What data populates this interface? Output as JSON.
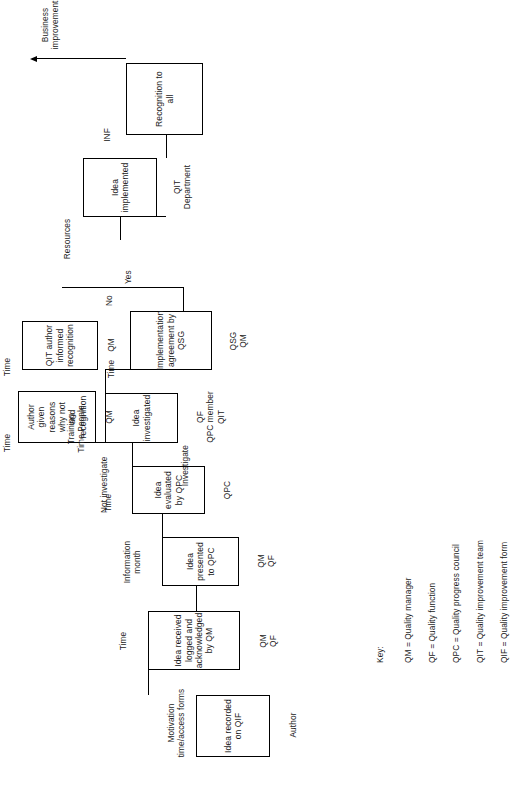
{
  "diagram": {
    "orientation": "rotated-90-ccw",
    "nodes": [
      {
        "id": "n1",
        "label": "Idea\nrecorded\non QIF"
      },
      {
        "id": "n2",
        "label": "Idea received logged\nand acknowledged\nby QM"
      },
      {
        "id": "n3",
        "label": "Idea\npresented\nto QPC"
      },
      {
        "id": "n4",
        "label": "Idea\nevaluated\nby QPC"
      },
      {
        "id": "n5",
        "label": "Idea\ninvestigated"
      },
      {
        "id": "n6",
        "label": "Author given\nreasons why not\nand recognition"
      },
      {
        "id": "n7",
        "label": "Implementation\nagreement\nby QSG"
      },
      {
        "id": "n8",
        "label": "QIT author\ninformed\nrecognition"
      },
      {
        "id": "n9",
        "label": "Idea\nimplemented"
      },
      {
        "id": "n10",
        "label": "Recognition\nto all"
      }
    ],
    "input_labels": [
      {
        "id": "i1",
        "text": "Motivation\ntime/access forms"
      },
      {
        "id": "i2",
        "text": "Time"
      },
      {
        "id": "i3",
        "text": "Information\nmonth"
      },
      {
        "id": "i4",
        "text": "Time"
      },
      {
        "id": "i5",
        "text": "Training\nTime People"
      },
      {
        "id": "i6",
        "text": "Time"
      },
      {
        "id": "i7",
        "text": "Time"
      },
      {
        "id": "i8",
        "text": "Time"
      },
      {
        "id": "i9",
        "text": "Resources"
      },
      {
        "id": "i10",
        "text": "INF"
      }
    ],
    "resource_labels": [
      {
        "id": "r1",
        "text": "Author"
      },
      {
        "id": "r2",
        "text": "QM\nQF"
      },
      {
        "id": "r3",
        "text": "QM\nQF"
      },
      {
        "id": "r4",
        "text": "QPC"
      },
      {
        "id": "r5",
        "text": "QF\nQPC member\nQIT"
      },
      {
        "id": "r6",
        "text": "QM"
      },
      {
        "id": "r7",
        "text": "QSG\nQM"
      },
      {
        "id": "r8",
        "text": "QM"
      },
      {
        "id": "r9",
        "text": "QIT\nDepartment"
      }
    ],
    "branch_labels": [
      {
        "id": "b1",
        "text": "Not investigate"
      },
      {
        "id": "b2",
        "text": "Investigate"
      },
      {
        "id": "b3",
        "text": "No"
      },
      {
        "id": "b4",
        "text": "Yes"
      }
    ],
    "output_label": {
      "id": "o1",
      "text": "Business\nimprovement"
    }
  },
  "key": {
    "title": "Key:",
    "entries": [
      "QM = Quality manager",
      "QF = Quality function",
      "QPC = Quality progress council",
      "QIT = Quality improvement team",
      "QIF = Quality improvement form"
    ]
  }
}
